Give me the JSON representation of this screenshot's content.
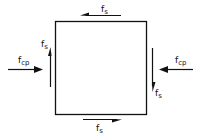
{
  "diagram": {
    "element": "square stress element",
    "colors": {
      "stroke": "#111111",
      "background": "#ffffff"
    },
    "labels": {
      "top_shear": {
        "main": "f",
        "sub": "s"
      },
      "bottom_shear": {
        "main": "f",
        "sub": "s"
      },
      "left_shear": {
        "main": "f",
        "sub": "s"
      },
      "right_shear": {
        "main": "f",
        "sub": "s"
      },
      "left_compression": {
        "main": "f",
        "sub": "cp"
      },
      "right_compression": {
        "main": "f",
        "sub": "cp"
      }
    },
    "arrows": [
      {
        "id": "top-shear",
        "direction": "left"
      },
      {
        "id": "bottom-shear",
        "direction": "right"
      },
      {
        "id": "left-shear",
        "direction": "up"
      },
      {
        "id": "right-shear",
        "direction": "down"
      },
      {
        "id": "left-compression",
        "direction": "right"
      },
      {
        "id": "right-compression",
        "direction": "left"
      }
    ]
  }
}
